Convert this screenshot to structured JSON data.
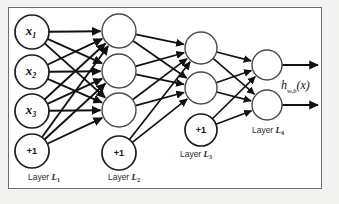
{
  "diagram": {
    "frame_border_color": "#6d6d6d",
    "page_background": "#f2f2f0",
    "frame_background": "#ffffff",
    "edge_color": "#111111",
    "node_stroke_color": "#4a4a4a",
    "node_fill_color": "#ffffff",
    "bias_text": "+1",
    "output_label": "h",
    "output_label_sub": "w,b",
    "output_label_arg": "(x)",
    "layers": [
      {
        "id": "L1",
        "label_prefix": "Layer ",
        "label_symbol": "L",
        "label_sub": "1",
        "label_x": 44,
        "label_y": 178,
        "cx": 32,
        "radius": 17,
        "units": [
          {
            "name": "x1",
            "text": "x",
            "sub": "1",
            "cy": 32,
            "type": "input"
          },
          {
            "name": "x2",
            "text": "x",
            "sub": "2",
            "cy": 72,
            "type": "input"
          },
          {
            "name": "x3",
            "text": "x",
            "sub": "3",
            "cy": 111,
            "type": "input"
          },
          {
            "name": "bias1",
            "text": "+1",
            "sub": "",
            "cy": 151,
            "type": "bias"
          }
        ]
      },
      {
        "id": "L2",
        "label_prefix": "Layer ",
        "label_symbol": "L",
        "label_sub": "2",
        "label_x": 124,
        "label_y": 178,
        "cx": 119,
        "radius": 17,
        "units": [
          {
            "name": "a1",
            "text": "",
            "sub": "",
            "cy": 31,
            "type": "hidden"
          },
          {
            "name": "a2",
            "text": "",
            "sub": "",
            "cy": 71,
            "type": "hidden"
          },
          {
            "name": "a3",
            "text": "",
            "sub": "",
            "cy": 110,
            "type": "hidden"
          },
          {
            "name": "bias2",
            "text": "+1",
            "sub": "",
            "cy": 153,
            "type": "bias"
          }
        ]
      },
      {
        "id": "L3",
        "label_prefix": "Layer ",
        "label_symbol": "L",
        "label_sub": "3",
        "label_x": 196,
        "label_y": 155,
        "cx": 201,
        "radius": 16,
        "units": [
          {
            "name": "b1",
            "text": "",
            "sub": "",
            "cy": 48,
            "type": "hidden"
          },
          {
            "name": "b2",
            "text": "",
            "sub": "",
            "cy": 88,
            "type": "hidden"
          },
          {
            "name": "bias3",
            "text": "+1",
            "sub": "",
            "cy": 130,
            "type": "bias"
          }
        ]
      },
      {
        "id": "L4",
        "label_prefix": "Layer ",
        "label_symbol": "L",
        "label_sub": "4",
        "label_x": 268,
        "label_y": 131,
        "cx": 267,
        "radius": 15,
        "units": [
          {
            "name": "o1",
            "text": "",
            "sub": "",
            "cy": 65,
            "type": "output"
          },
          {
            "name": "o2",
            "text": "",
            "sub": "",
            "cy": 105,
            "type": "output"
          }
        ]
      }
    ],
    "output_arrow_end_x": 318,
    "output_label_x": 281,
    "output_label_y": 87
  }
}
